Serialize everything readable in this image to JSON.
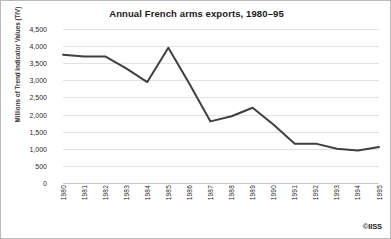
{
  "chart_data": {
    "type": "line",
    "title": "Annual French arms exports, 1980–95",
    "xlabel": "",
    "ylabel": "Millions of Trend Indicator Values (TIV)",
    "categories": [
      "1980",
      "1981",
      "1982",
      "1983",
      "1984",
      "1985",
      "1986",
      "1987",
      "1988",
      "1989",
      "1990",
      "1991",
      "1992",
      "1993",
      "1994",
      "1995"
    ],
    "values": [
      3750,
      3700,
      3700,
      3350,
      2950,
      3950,
      2900,
      1800,
      1950,
      2200,
      1700,
      1150,
      1150,
      1000,
      950,
      1050
    ],
    "series": [
      {
        "name": "French arms exports",
        "values": [
          3750,
          3700,
          3700,
          3350,
          2950,
          3950,
          2900,
          1800,
          1950,
          2200,
          1700,
          1150,
          1150,
          1000,
          950,
          1050
        ]
      }
    ],
    "ylim": [
      0,
      4500
    ],
    "ytick_values": [
      0,
      500,
      1000,
      1500,
      2000,
      2500,
      3000,
      3500,
      4000,
      4500
    ],
    "ytick_labels": [
      "0",
      "500",
      "1,000",
      "1,500",
      "2,000",
      "2,500",
      "3,000",
      "3,500",
      "4,000",
      "4,500"
    ],
    "grid": true,
    "legend": false,
    "line_color": "#3f3f3f",
    "grid_color": "#e2e2e2",
    "background_color": "#ffffff"
  },
  "credit": {
    "label": "©IISS"
  }
}
